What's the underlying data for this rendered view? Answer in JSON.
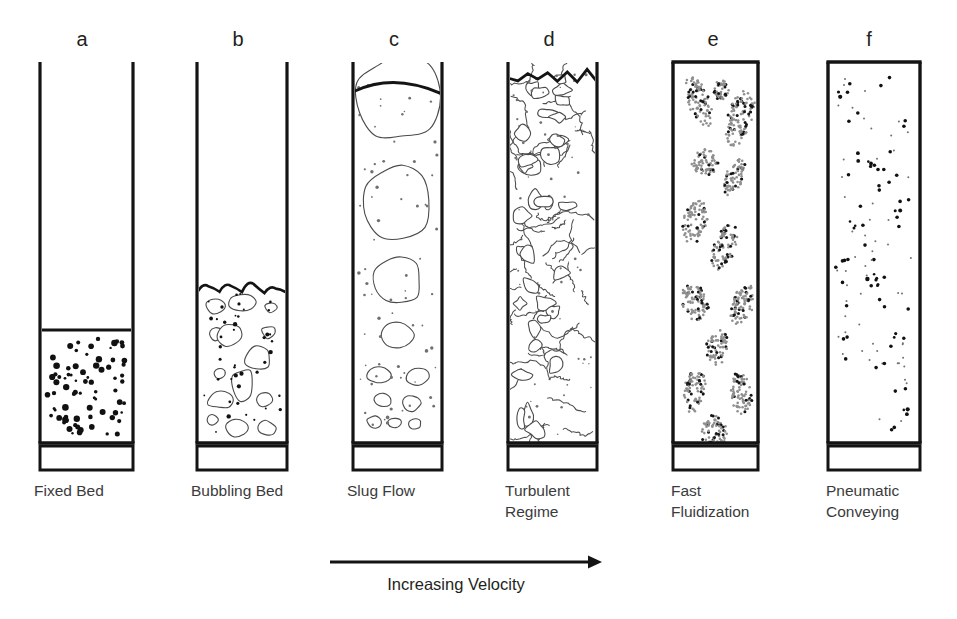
{
  "figure": {
    "background_color": "#ffffff",
    "ink_color": "#141414",
    "caption_color": "#3b3b3b",
    "axis_caption": "Increasing Velocity",
    "axis_arrow": {
      "direction": "right",
      "x_start": 330,
      "x_end": 602,
      "y": 562
    }
  },
  "panels": [
    {
      "letter": "a",
      "caption": "Fixed Bed",
      "caption_lines": [
        "Fixed Bed"
      ],
      "letter_x": 82,
      "caption_x": 34,
      "column": {
        "x": 40,
        "width": 93,
        "top": 62,
        "bottom": 443,
        "open_top": true
      },
      "plenum": {
        "top": 446,
        "bottom": 470
      },
      "bed": {
        "top": 330,
        "surface_style": "flat",
        "fill": "dense-dots"
      },
      "texture": "discrete-particles"
    },
    {
      "letter": "b",
      "caption": "Bubbling Bed",
      "caption_lines": [
        "Bubbling Bed"
      ],
      "letter_x": 238,
      "caption_x": 191,
      "column": {
        "x": 197,
        "width": 90,
        "top": 62,
        "bottom": 443,
        "open_top": true
      },
      "plenum": {
        "top": 446,
        "bottom": 470
      },
      "bed": {
        "top": 288,
        "surface_style": "undulating",
        "fill": "bubbles-and-dots"
      },
      "texture": "small-bubbles"
    },
    {
      "letter": "c",
      "caption": "Slug Flow",
      "caption_lines": [
        "Slug Flow"
      ],
      "letter_x": 394,
      "caption_x": 347,
      "column": {
        "x": 353,
        "width": 89,
        "top": 62,
        "bottom": 443,
        "open_top": true
      },
      "plenum": {
        "top": 446,
        "bottom": 470
      },
      "bed": {
        "top": 80,
        "surface_style": "domed",
        "fill": "slugs-and-dots"
      },
      "texture": "coalescing-slugs"
    },
    {
      "letter": "d",
      "caption": "Turbulent Regime",
      "caption_lines": [
        "Turbulent",
        "Regime"
      ],
      "letter_x": 549,
      "caption_x": 505,
      "column": {
        "x": 508,
        "width": 89,
        "top": 62,
        "bottom": 443,
        "open_top": true
      },
      "plenum": {
        "top": 446,
        "bottom": 470
      },
      "bed": {
        "top": 68,
        "surface_style": "jagged",
        "fill": "chaotic-voids"
      },
      "texture": "turbulent-voids"
    },
    {
      "letter": "e",
      "caption": "Fast Fluidization",
      "caption_lines": [
        "Fast",
        "Fluidization"
      ],
      "letter_x": 713,
      "caption_x": 671,
      "column": {
        "x": 673,
        "width": 85,
        "top": 62,
        "bottom": 443,
        "open_top": false
      },
      "plenum": {
        "top": 446,
        "bottom": 470
      },
      "bed": {
        "top": 62,
        "surface_style": "none",
        "fill": "clusters"
      },
      "texture": "particle-clusters"
    },
    {
      "letter": "f",
      "caption": "Pneumatic Conveying",
      "caption_lines": [
        "Pneumatic",
        "Conveying"
      ],
      "letter_x": 869,
      "caption_x": 826,
      "column": {
        "x": 828,
        "width": 92,
        "top": 62,
        "bottom": 443,
        "open_top": false
      },
      "plenum": {
        "top": 446,
        "bottom": 470
      },
      "bed": {
        "top": 62,
        "surface_style": "none",
        "fill": "sparse-particles"
      },
      "texture": "dilute-particles"
    }
  ],
  "caption_rows": {
    "row1_y": 496,
    "row2_y": 517
  },
  "letters_y": 46
}
